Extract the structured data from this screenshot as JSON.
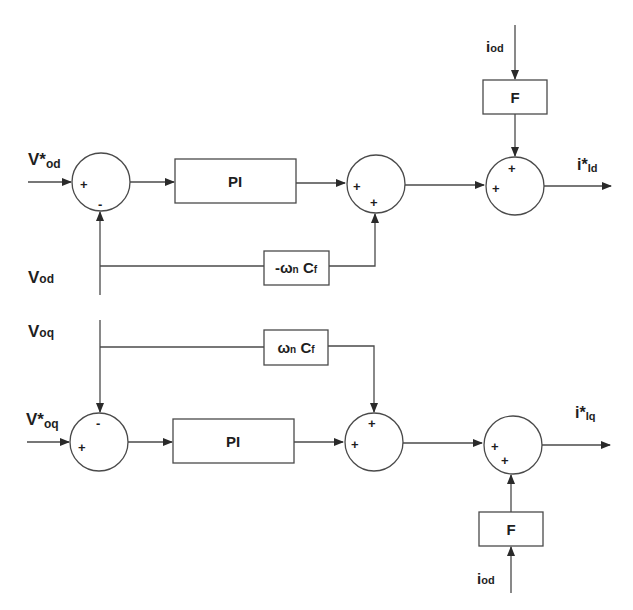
{
  "diagram": {
    "type": "control-block-diagram",
    "d_axis": {
      "input_ref": {
        "main": "V*",
        "sub": "od"
      },
      "feedback": {
        "main": "V",
        "sub": "od"
      },
      "sum1_signs": {
        "left": "+",
        "bottom": "-"
      },
      "controller": "PI",
      "cross_gain": {
        "prefix": "-ω",
        "sub_n": "n",
        "c": " C",
        "sub_f": "f"
      },
      "sum2_signs": {
        "left": "+",
        "bottom": "+"
      },
      "ff_input": {
        "main": "i",
        "sub": "od"
      },
      "ff_block": "F",
      "sum3_signs": {
        "left": "+",
        "top": "+"
      },
      "output": {
        "main": "i*",
        "sub": "Id"
      }
    },
    "q_axis": {
      "input_ref": {
        "main": "V*",
        "sub": "oq"
      },
      "feedback": {
        "main": "V",
        "sub": "oq"
      },
      "sum1_signs": {
        "left": "+",
        "top": "-"
      },
      "controller": "PI",
      "cross_gain": {
        "prefix": "ω",
        "sub_n": "n",
        "c": " C",
        "sub_f": "f"
      },
      "sum2_signs": {
        "left": "+",
        "top": "+"
      },
      "ff_input": {
        "main": "i",
        "sub": "od"
      },
      "ff_block": "F",
      "sum3_signs": {
        "left": "+",
        "bottom": "+"
      },
      "output": {
        "main": "i*",
        "sub": "Iq"
      }
    },
    "colors": {
      "line": "#4a4a4a",
      "text": "#1e1e1e",
      "background": "#ffffff"
    }
  }
}
